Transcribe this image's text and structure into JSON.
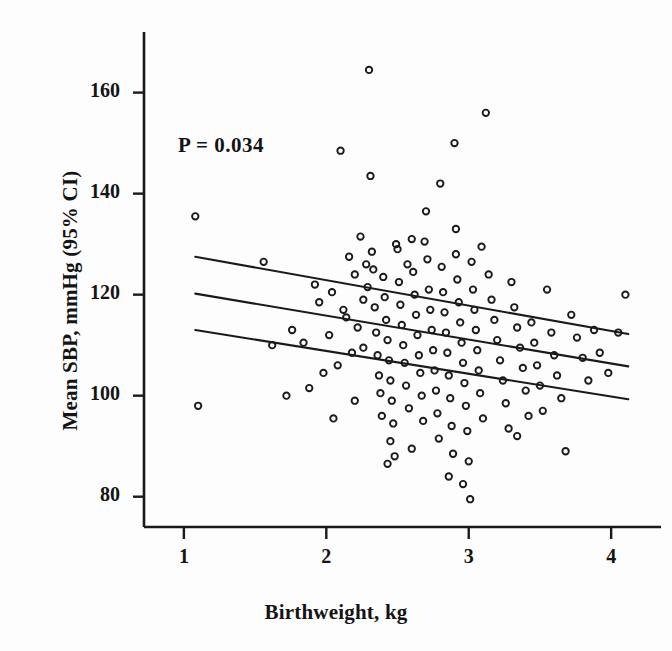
{
  "figure": {
    "type": "scatter-with-regression",
    "background_color": "#fdfdfd",
    "ink_color": "#1a1a1a"
  },
  "annotations": {
    "p_value_text": "P = 0.034"
  },
  "axes": {
    "x": {
      "title": "Birthweight, kg",
      "tick_labels": [
        "1",
        "2",
        "3",
        "4"
      ],
      "tick_values": [
        1,
        2,
        3,
        4
      ],
      "range": [
        0.72,
        4.35
      ]
    },
    "y": {
      "title": "Mean SBP, mmHg (95% CI)",
      "tick_labels": [
        "80",
        "100",
        "120",
        "140",
        "160"
      ],
      "tick_values": [
        80,
        100,
        120,
        140,
        160
      ],
      "range": [
        74,
        172
      ]
    }
  },
  "chart_data": {
    "type": "scatter",
    "title": "",
    "xlabel": "Birthweight, kg",
    "ylabel": "Mean SBP, mmHg (95% CI)",
    "xlim": [
      0.72,
      4.35
    ],
    "ylim": [
      74,
      172
    ],
    "grid": false,
    "legend": null,
    "annotations": [
      {
        "text": "P = 0.034",
        "x": 1.9,
        "y": 145
      }
    ],
    "marker": {
      "shape": "open-circle",
      "radius_px": 3.2,
      "stroke": "#1a1a1a",
      "fill": "none"
    },
    "series": [
      {
        "name": "Participants",
        "points": [
          [
            1.08,
            135.5
          ],
          [
            1.1,
            98.0
          ],
          [
            1.56,
            126.5
          ],
          [
            1.62,
            110.0
          ],
          [
            1.72,
            100.0
          ],
          [
            1.76,
            113.0
          ],
          [
            1.84,
            110.5
          ],
          [
            1.92,
            122.0
          ],
          [
            1.95,
            118.5
          ],
          [
            1.98,
            104.5
          ],
          [
            2.02,
            112.0
          ],
          [
            2.05,
            95.5
          ],
          [
            2.08,
            106.0
          ],
          [
            2.1,
            148.5
          ],
          [
            2.12,
            117.0
          ],
          [
            2.16,
            127.5
          ],
          [
            2.18,
            108.5
          ],
          [
            2.2,
            124.0
          ],
          [
            2.22,
            113.5
          ],
          [
            2.24,
            131.5
          ],
          [
            2.26,
            119.0
          ],
          [
            2.28,
            126.0
          ],
          [
            2.29,
            121.5
          ],
          [
            2.3,
            164.5
          ],
          [
            2.31,
            143.5
          ],
          [
            2.32,
            128.5
          ],
          [
            2.33,
            125.0
          ],
          [
            2.34,
            117.5
          ],
          [
            2.35,
            112.5
          ],
          [
            2.36,
            108.0
          ],
          [
            2.37,
            104.0
          ],
          [
            2.38,
            100.5
          ],
          [
            2.39,
            96.0
          ],
          [
            2.4,
            123.5
          ],
          [
            2.41,
            119.5
          ],
          [
            2.42,
            115.0
          ],
          [
            2.43,
            111.0
          ],
          [
            2.44,
            107.0
          ],
          [
            2.45,
            103.0
          ],
          [
            2.46,
            99.0
          ],
          [
            2.47,
            94.5
          ],
          [
            2.48,
            88.0
          ],
          [
            2.5,
            129.0
          ],
          [
            2.51,
            122.5
          ],
          [
            2.52,
            118.0
          ],
          [
            2.53,
            114.0
          ],
          [
            2.54,
            110.0
          ],
          [
            2.55,
            106.5
          ],
          [
            2.56,
            102.0
          ],
          [
            2.58,
            97.5
          ],
          [
            2.6,
            131.0
          ],
          [
            2.61,
            124.5
          ],
          [
            2.62,
            120.0
          ],
          [
            2.63,
            116.0
          ],
          [
            2.64,
            112.0
          ],
          [
            2.65,
            108.0
          ],
          [
            2.66,
            104.5
          ],
          [
            2.67,
            100.0
          ],
          [
            2.68,
            95.0
          ],
          [
            2.7,
            136.5
          ],
          [
            2.71,
            127.0
          ],
          [
            2.72,
            121.0
          ],
          [
            2.73,
            117.0
          ],
          [
            2.74,
            113.0
          ],
          [
            2.75,
            109.0
          ],
          [
            2.76,
            105.0
          ],
          [
            2.77,
            101.0
          ],
          [
            2.78,
            96.5
          ],
          [
            2.79,
            91.5
          ],
          [
            2.8,
            142.0
          ],
          [
            2.81,
            125.5
          ],
          [
            2.82,
            120.5
          ],
          [
            2.83,
            116.5
          ],
          [
            2.84,
            112.5
          ],
          [
            2.85,
            108.5
          ],
          [
            2.86,
            104.0
          ],
          [
            2.87,
            99.5
          ],
          [
            2.88,
            94.0
          ],
          [
            2.89,
            88.5
          ],
          [
            2.9,
            150.0
          ],
          [
            2.91,
            128.0
          ],
          [
            2.92,
            123.0
          ],
          [
            2.93,
            118.5
          ],
          [
            2.94,
            114.5
          ],
          [
            2.95,
            110.5
          ],
          [
            2.96,
            106.5
          ],
          [
            2.97,
            102.5
          ],
          [
            2.98,
            98.0
          ],
          [
            2.99,
            93.0
          ],
          [
            3.0,
            87.0
          ],
          [
            3.01,
            79.5
          ],
          [
            3.02,
            126.5
          ],
          [
            3.03,
            121.0
          ],
          [
            3.04,
            117.0
          ],
          [
            3.05,
            113.0
          ],
          [
            3.06,
            109.0
          ],
          [
            3.07,
            105.0
          ],
          [
            3.08,
            100.5
          ],
          [
            3.1,
            95.5
          ],
          [
            3.12,
            156.0
          ],
          [
            3.14,
            124.0
          ],
          [
            3.16,
            119.0
          ],
          [
            3.18,
            115.0
          ],
          [
            3.2,
            111.0
          ],
          [
            3.22,
            107.0
          ],
          [
            3.24,
            103.0
          ],
          [
            3.26,
            98.5
          ],
          [
            3.28,
            93.5
          ],
          [
            3.3,
            122.5
          ],
          [
            3.32,
            117.5
          ],
          [
            3.34,
            113.5
          ],
          [
            3.36,
            109.5
          ],
          [
            3.38,
            105.5
          ],
          [
            3.4,
            101.0
          ],
          [
            3.42,
            96.0
          ],
          [
            3.44,
            114.5
          ],
          [
            3.46,
            110.5
          ],
          [
            3.48,
            106.0
          ],
          [
            3.5,
            102.0
          ],
          [
            3.52,
            97.0
          ],
          [
            3.55,
            121.0
          ],
          [
            3.58,
            112.5
          ],
          [
            3.6,
            108.0
          ],
          [
            3.62,
            104.0
          ],
          [
            3.65,
            99.5
          ],
          [
            3.68,
            89.0
          ],
          [
            3.72,
            116.0
          ],
          [
            3.76,
            111.5
          ],
          [
            3.8,
            107.5
          ],
          [
            3.84,
            103.0
          ],
          [
            3.88,
            113.0
          ],
          [
            3.92,
            108.5
          ],
          [
            3.98,
            104.5
          ],
          [
            4.05,
            112.5
          ],
          [
            4.1,
            120.0
          ],
          [
            2.04,
            120.5
          ],
          [
            2.14,
            115.5
          ],
          [
            2.26,
            109.5
          ],
          [
            2.49,
            130.0
          ],
          [
            2.57,
            126.0
          ],
          [
            2.69,
            130.5
          ],
          [
            2.91,
            133.0
          ],
          [
            3.09,
            129.5
          ],
          [
            2.43,
            86.5
          ],
          [
            2.86,
            84.0
          ],
          [
            2.96,
            82.5
          ],
          [
            2.6,
            89.5
          ],
          [
            2.45,
            91.0
          ],
          [
            3.34,
            92.0
          ],
          [
            2.2,
            99.0
          ],
          [
            1.88,
            101.5
          ]
        ]
      }
    ],
    "fit_line": {
      "name": "Regression fit",
      "x": [
        1.08,
        4.12
      ],
      "y": [
        120.2,
        105.8
      ]
    },
    "confidence_band": {
      "level": "95%",
      "upper": {
        "x": [
          1.08,
          4.12
        ],
        "y": [
          127.5,
          112.2
        ]
      },
      "lower": {
        "x": [
          1.08,
          4.12
        ],
        "y": [
          113.0,
          99.3
        ]
      }
    }
  }
}
